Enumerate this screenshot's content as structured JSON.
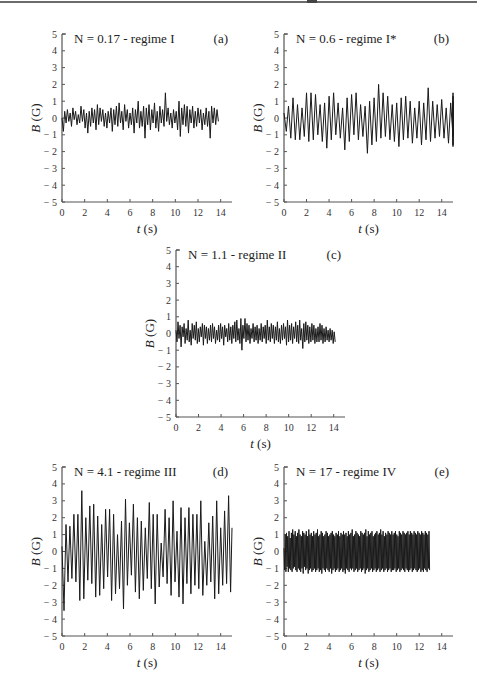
{
  "chart_data": [
    {
      "id": "a",
      "type": "line",
      "panel_label": "(a)",
      "annotation": "N = 0.17 - regime I",
      "xlabel": "t (s)",
      "ylabel": "B (G)",
      "xlim": [
        0,
        15
      ],
      "ylim": [
        -5,
        5
      ],
      "xticks": [
        0,
        2,
        4,
        6,
        8,
        10,
        12,
        14
      ],
      "yticks": [
        5,
        4,
        3,
        2,
        1,
        0,
        -1,
        -2,
        -3,
        -4,
        -5
      ],
      "ytick_labels": [
        "5",
        "4",
        "3",
        "2",
        "1",
        "0",
        "− 1",
        "− 2",
        "− 3",
        "− 4",
        "− 5"
      ],
      "grid": false,
      "description": "Small irregular fluctuation around 0, amplitude roughly ±0.5 G, occasional spike to 1.5 G near t = 9.6 s",
      "series": [
        {
          "name": "B(t)",
          "x_step": 0.12,
          "y": [
            0.0,
            -0.8,
            0.4,
            -0.3,
            0.5,
            -0.2,
            0.3,
            -0.5,
            0.6,
            -0.1,
            0.4,
            -0.4,
            0.2,
            -0.3,
            0.7,
            -0.2,
            0.5,
            -0.6,
            0.3,
            -0.9,
            0.4,
            -0.5,
            0.6,
            -0.3,
            0.5,
            -0.7,
            0.8,
            -0.4,
            0.6,
            -0.2,
            0.5,
            -0.5,
            0.3,
            -0.6,
            0.4,
            -0.3,
            0.6,
            -0.8,
            0.5,
            -0.4,
            0.7,
            -0.5,
            0.9,
            -0.3,
            0.4,
            -0.7,
            0.8,
            -0.2,
            0.5,
            -0.6,
            0.3,
            -0.4,
            0.6,
            -0.9,
            0.5,
            -0.3,
            1.0,
            -0.6,
            0.4,
            -0.5,
            0.7,
            -1.2,
            0.6,
            -0.4,
            0.8,
            -0.7,
            0.5,
            -0.3,
            0.9,
            -0.6,
            0.4,
            -0.8,
            0.7,
            -0.3,
            0.5,
            -0.5,
            1.5,
            -0.2,
            0.6,
            -0.4,
            0.3,
            -0.6,
            0.5,
            -0.3,
            0.4,
            -0.7,
            1.0,
            -1.1,
            0.6,
            -0.4,
            0.8,
            -0.5,
            0.7,
            -0.9,
            0.5,
            -0.3,
            0.7,
            -0.6,
            0.4,
            -0.5,
            0.6,
            -0.3,
            0.5,
            -0.7,
            0.3,
            -0.4,
            0.6,
            -0.5,
            0.4,
            -1.2,
            0.7,
            -0.3,
            0.6,
            -0.4,
            0.5,
            -0.2
          ]
        }
      ]
    },
    {
      "id": "b",
      "type": "line",
      "panel_label": "(b)",
      "annotation": "N = 0.6 - regime I*",
      "xlabel": "t (s)",
      "ylabel": "B (G)",
      "xlim": [
        0,
        15
      ],
      "ylim": [
        -5,
        5
      ],
      "xticks": [
        0,
        2,
        4,
        6,
        8,
        10,
        12,
        14
      ],
      "yticks": [
        5,
        4,
        3,
        2,
        1,
        0,
        -1,
        -2,
        -3,
        -4,
        -5
      ],
      "ytick_labels": [
        "5",
        "4",
        "3",
        "2",
        "1",
        "0",
        "− 1",
        "− 2",
        "− 3",
        "− 4",
        "− 5"
      ],
      "grid": false,
      "description": "Quasi-periodic oscillation, amplitude about ±1.4 G, max near 2 G at t = 8 s, min near -2.1 G at t = 7.3 s",
      "series": [
        {
          "name": "B(t)",
          "x_step": 0.2,
          "y": [
            0.3,
            -0.8,
            0.7,
            -1.2,
            1.2,
            -1.3,
            0.8,
            -1.3,
            0.6,
            -1.1,
            1.5,
            -1.4,
            1.5,
            -1.3,
            1.4,
            -1.0,
            0.8,
            -1.4,
            0.9,
            -1.8,
            1.3,
            -1.3,
            1.5,
            -1.0,
            0.9,
            -1.2,
            0.6,
            -1.9,
            1.2,
            -1.4,
            1.4,
            -1.0,
            1.5,
            -1.3,
            0.8,
            -1.1,
            0.7,
            -2.1,
            1.0,
            -1.6,
            1.2,
            -1.4,
            2.0,
            -1.2,
            1.5,
            -1.1,
            1.3,
            -1.3,
            0.8,
            -1.4,
            0.9,
            -1.7,
            1.2,
            -1.3,
            1.3,
            -1.2,
            1.0,
            -1.5,
            0.6,
            -1.2,
            1.0,
            -1.6,
            0.9,
            -1.3,
            1.8,
            -1.4,
            1.0,
            -1.2,
            0.8,
            -1.1,
            1.1,
            -1.2,
            0.6,
            -1.5,
            0.9,
            -1.1,
            1.3,
            -1.6,
            1.5,
            -1.7,
            1.0,
            -1.0
          ]
        }
      ]
    },
    {
      "id": "c",
      "type": "line",
      "panel_label": "(c)",
      "annotation": "N = 1.1 - regime II",
      "xlabel": "t (s)",
      "ylabel": "B (G)",
      "xlim": [
        0,
        15
      ],
      "ylim": [
        -5,
        5
      ],
      "xticks": [
        0,
        2,
        4,
        6,
        8,
        10,
        12,
        14
      ],
      "yticks": [
        5,
        4,
        3,
        2,
        1,
        0,
        -1,
        -2,
        -3,
        -4,
        -5
      ],
      "ytick_labels": [
        "5",
        "4",
        "3",
        "2",
        "1",
        "0",
        "− 1",
        "− 2",
        "− 3",
        "− 4",
        "− 5"
      ],
      "grid": false,
      "description": "Dense noisy fluctuation around 0, amplitude about ±0.6 G, peaks near 0.9 G at t = 6 s",
      "series": [
        {
          "name": "B(t)",
          "x_step": 0.09,
          "y": [
            0.2,
            -0.5,
            0.7,
            -0.3,
            0.5,
            -0.8,
            0.4,
            -0.2,
            0.6,
            -0.6,
            0.3,
            -0.4,
            0.8,
            -0.5,
            0.2,
            -0.7,
            0.6,
            -0.3,
            0.5,
            -0.4,
            0.7,
            -0.6,
            0.3,
            -0.5,
            0.4,
            -0.2,
            0.6,
            -0.7,
            0.5,
            -0.3,
            0.4,
            -0.6,
            0.3,
            -0.4,
            0.5,
            -0.5,
            0.6,
            -0.3,
            0.4,
            -0.6,
            0.2,
            -0.4,
            0.5,
            -0.5,
            0.6,
            -0.3,
            0.4,
            -0.7,
            0.5,
            -0.2,
            0.3,
            -0.5,
            0.6,
            -0.4,
            0.4,
            -0.6,
            0.5,
            -0.3,
            0.7,
            -0.5,
            0.8,
            -0.4,
            0.3,
            -0.6,
            0.9,
            -1.0,
            0.5,
            -0.3,
            0.9,
            -0.5,
            0.6,
            -0.4,
            0.5,
            -0.6,
            0.3,
            -0.3,
            0.6,
            -0.5,
            0.4,
            -0.4,
            0.5,
            -0.6,
            0.3,
            -0.4,
            0.6,
            -0.5,
            0.4,
            -0.3,
            0.5,
            -0.6,
            0.8,
            -0.4,
            0.4,
            -0.5,
            0.6,
            -0.3,
            0.5,
            -0.6,
            0.4,
            -0.4,
            0.7,
            -0.5,
            0.3,
            -0.6,
            0.5,
            -0.4,
            0.6,
            -0.3,
            0.4,
            -0.7,
            0.8,
            -0.5,
            0.5,
            -0.4,
            0.6,
            -0.6,
            0.4,
            -0.3,
            0.7,
            -0.5,
            0.5,
            -0.6,
            0.8,
            -0.4,
            0.3,
            -0.9,
            0.6,
            -0.5,
            0.7,
            -0.4,
            0.5,
            -0.6,
            0.4,
            -0.5,
            0.6,
            -0.4,
            0.5,
            -0.6,
            0.3,
            -0.5,
            0.4,
            -0.5,
            0.6,
            -0.4,
            0.5,
            -0.6,
            0.3,
            -0.5,
            0.4,
            -0.4,
            0.2,
            -0.5,
            0.3,
            -0.4,
            0.2,
            -0.6,
            0.1,
            -0.5
          ]
        }
      ]
    },
    {
      "id": "d",
      "type": "line",
      "panel_label": "(d)",
      "annotation": "N = 4.1 - regime III",
      "xlabel": "t (s)",
      "ylabel": "B (G)",
      "xlim": [
        0,
        15
      ],
      "ylim": [
        -5,
        5
      ],
      "xticks": [
        0,
        2,
        4,
        6,
        8,
        10,
        12,
        14
      ],
      "yticks": [
        5,
        4,
        3,
        2,
        1,
        0,
        -1,
        -2,
        -3,
        -4,
        -5
      ],
      "ytick_labels": [
        "5",
        "4",
        "3",
        "2",
        "1",
        "0",
        "− 1",
        "− 2",
        "− 3",
        "− 4",
        "− 5"
      ],
      "grid": false,
      "description": "Large periodic oscillation, amplitude about ±2.5 G, max about 3.6 G at t = 1.8 s, min about -3.5 G at t = 0.3 s",
      "series": [
        {
          "name": "B(t)",
          "x_step": 0.175,
          "y": [
            0.3,
            -3.5,
            1.6,
            -1.8,
            1.5,
            -1.6,
            2.2,
            -1.8,
            2.2,
            -2.9,
            3.6,
            -2.8,
            2.0,
            -1.7,
            2.7,
            -1.9,
            2.8,
            -2.7,
            2.1,
            -2.6,
            1.6,
            -2.2,
            2.5,
            -1.5,
            2.5,
            -2.9,
            2.2,
            -2.5,
            1.0,
            -2.2,
            1.8,
            -3.4,
            3.1,
            -2.0,
            1.7,
            -1.4,
            2.8,
            -2.4,
            2.0,
            -2.8,
            1.8,
            -2.3,
            1.4,
            -1.6,
            2.9,
            -2.2,
            2.2,
            -3.1,
            2.2,
            -2.1,
            0.5,
            -1.5,
            2.5,
            -1.9,
            2.0,
            -2.6,
            3.0,
            -1.8,
            1.2,
            -2.7,
            2.6,
            -3.1,
            2.0,
            -1.9,
            2.6,
            -2.5,
            2.2,
            -2.0,
            2.2,
            -2.2,
            3.0,
            -2.6,
            0.6,
            -2.0,
            1.7,
            -1.8,
            2.1,
            -2.8,
            3.0,
            -2.5,
            1.4,
            -2.0,
            2.4,
            -1.9,
            3.3,
            -2.4,
            1.4
          ]
        }
      ]
    },
    {
      "id": "e",
      "type": "line",
      "panel_label": "(e)",
      "annotation": "N = 17 - regime IV",
      "xlabel": "t (s)",
      "ylabel": "B (G)",
      "xlim": [
        0,
        15
      ],
      "ylim": [
        -5,
        5
      ],
      "xticks": [
        0,
        2,
        4,
        6,
        8,
        10,
        12,
        14
      ],
      "yticks": [
        5,
        4,
        3,
        2,
        1,
        0,
        -1,
        -2,
        -3,
        -4,
        -5
      ],
      "ytick_labels": [
        "5",
        "4",
        "3",
        "2",
        "1",
        "0",
        "− 1",
        "− 2",
        "− 3",
        "− 4",
        "− 5"
      ],
      "grid": false,
      "description": "High-frequency oscillation with nearly constant amplitude about ±1.2 G across the whole record",
      "series": [
        {
          "name": "B(t)",
          "x_step": 0.055,
          "y": [
            0.2,
            -1.1,
            1.0,
            -1.2,
            1.1,
            -0.9,
            0.9,
            -1.2,
            1.2,
            -1.0,
            0.8,
            -1.1,
            1.1,
            -1.2,
            1.3,
            -1.0,
            1.0,
            -0.9,
            1.2,
            -1.1,
            0.9,
            -1.2,
            1.1,
            -1.0,
            1.3,
            -1.1,
            1.0,
            -1.2,
            0.9,
            -1.0,
            1.2,
            -1.3,
            1.1,
            -0.9,
            1.0,
            -1.1,
            1.2,
            -1.0,
            0.9,
            -1.3,
            1.3,
            -1.1,
            1.0,
            -1.0,
            1.1,
            -1.2,
            0.9,
            -1.1,
            1.2,
            -1.0,
            1.0,
            -1.2,
            1.1,
            -1.1,
            1.3,
            -1.0,
            0.9,
            -1.2,
            1.0,
            -1.1,
            1.2,
            -1.3,
            1.1,
            -1.0,
            0.9,
            -1.1,
            1.0,
            -1.2,
            1.2,
            -1.0,
            1.1,
            -1.1,
            0.9,
            -1.2,
            1.0,
            -1.0,
            1.1,
            -1.3,
            1.2,
            -1.1,
            1.0,
            -1.0,
            0.9,
            -1.2,
            1.1,
            -1.1,
            1.0,
            -1.0,
            1.2,
            -1.2,
            0.9,
            -1.1,
            1.1,
            -1.0,
            1.0,
            -1.2,
            1.2,
            -1.1,
            1.0,
            -1.3,
            1.1,
            -1.0,
            0.9,
            -1.1,
            1.2,
            -1.2,
            1.0,
            -1.0,
            1.1,
            -1.1,
            1.3,
            -1.0,
            0.9,
            -1.2,
            1.0,
            -1.1,
            1.2,
            -1.0,
            1.1,
            -1.2,
            1.0,
            -1.1,
            0.9,
            -1.0,
            1.2,
            -1.2,
            1.1,
            -1.1,
            1.0,
            -1.0,
            1.1,
            -1.3,
            1.3,
            -1.1,
            0.9,
            -1.0,
            1.2,
            -1.2,
            1.0,
            -1.1,
            1.1,
            -1.0,
            1.2,
            -1.2,
            0.9,
            -1.1,
            1.0,
            -1.0,
            1.1,
            -1.2,
            1.2,
            -1.1,
            1.0,
            -1.0,
            1.1,
            -1.2,
            1.3,
            -1.1,
            1.0,
            -1.0,
            1.2,
            -1.2,
            0.9,
            -1.1,
            1.1,
            -1.0,
            1.0,
            -1.2,
            1.2,
            -1.1,
            1.1,
            -1.0,
            1.0,
            -1.2,
            1.2,
            -1.1,
            1.0,
            -1.1,
            1.1,
            -1.0,
            1.2,
            -1.2,
            1.0,
            -1.1,
            0.9,
            -1.0,
            1.2,
            -1.2,
            1.1,
            -1.1,
            1.0,
            -1.0,
            1.2,
            -1.1,
            1.1,
            -1.2,
            1.0,
            -1.0,
            1.1,
            -1.1,
            1.2,
            -1.2,
            1.0,
            -1.1,
            1.2,
            -1.0,
            1.1,
            -1.2,
            1.0,
            -1.1,
            1.2,
            -1.0,
            1.1,
            -1.1,
            1.0,
            -1.2,
            1.2,
            -1.1,
            1.1,
            -1.0,
            1.0,
            -1.2,
            1.2,
            -1.1,
            1.1,
            -1.2,
            1.0,
            -1.0,
            1.2,
            -1.1,
            1.1,
            -1.2,
            1.0,
            -1.0,
            1.2,
            -1.1
          ]
        }
      ]
    }
  ],
  "layout": {
    "panels": [
      {
        "id": "a",
        "left": 62,
        "top": 34,
        "right": 232,
        "bottom": 202
      },
      {
        "id": "b",
        "left": 284,
        "top": 34,
        "right": 453,
        "bottom": 202
      },
      {
        "id": "c",
        "left": 176,
        "top": 250,
        "right": 345,
        "bottom": 417
      },
      {
        "id": "d",
        "left": 62,
        "top": 467,
        "right": 232,
        "bottom": 636
      },
      {
        "id": "e",
        "left": 284,
        "top": 467,
        "right": 453,
        "bottom": 636
      }
    ],
    "colors": {
      "line": "#1a1a1a",
      "axis": "#555555",
      "text": "#222222"
    }
  }
}
